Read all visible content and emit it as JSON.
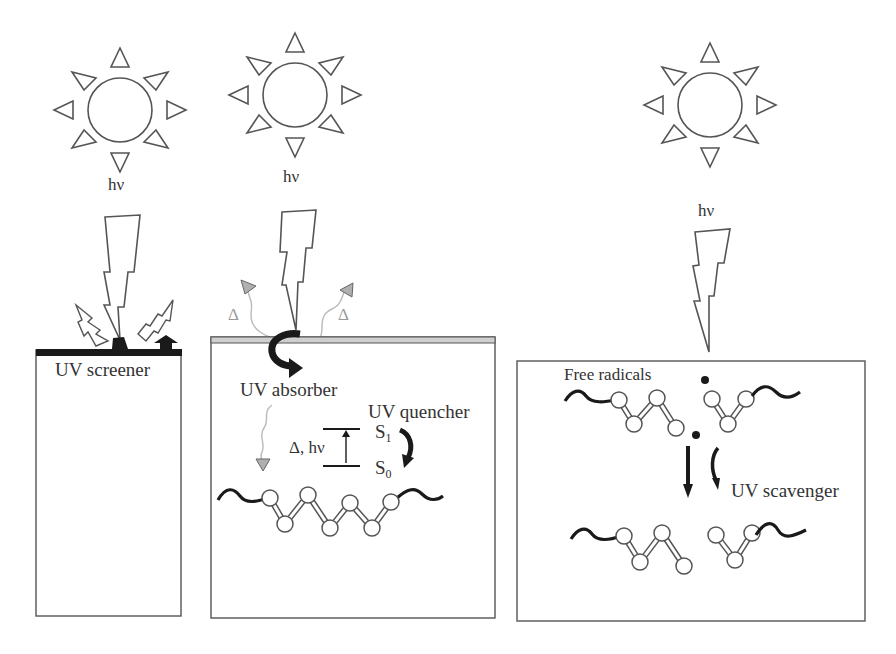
{
  "colors": {
    "stroke": "#555555",
    "dark": "#1a1a1a",
    "coating": "#cfcfcf",
    "heat_wave": "#bdbdbd",
    "heat_triangle": "#b0b0b0",
    "text": "#333333"
  },
  "panels": [
    {
      "id": "screener",
      "photon_label": "hν",
      "label": "UV screener",
      "icons": [
        "sun-icon",
        "lightning-bolt-icon",
        "reflected-bolt-icon",
        "reflected-bolt-icon",
        "surface-layer"
      ]
    },
    {
      "id": "absorber-quencher",
      "photon_label": "hν",
      "absorber_label": "UV absorber",
      "quencher_label": "UV quencher",
      "heat_symbol": "Δ",
      "transition_label": "Δ, hν",
      "state_upper": "S",
      "state_upper_sub": "1",
      "state_lower": "S",
      "state_lower_sub": "0",
      "icons": [
        "sun-icon",
        "lightning-bolt-icon",
        "curved-arrow-icon",
        "heat-wave-icon",
        "polymer-chain-icon"
      ]
    },
    {
      "id": "scavenger",
      "photon_label": "hν",
      "radicals_label": "Free radicals",
      "scavenger_label": "UV scavenger",
      "icons": [
        "sun-icon",
        "lightning-bolt-icon",
        "radical-dot-icon",
        "down-arrow-icon",
        "curved-arrow-icon",
        "polymer-chain-icon"
      ]
    }
  ]
}
